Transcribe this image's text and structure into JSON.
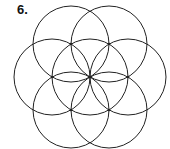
{
  "figure": {
    "label": "6.",
    "stroke_color": "#222222",
    "center": [
      90,
      77
    ],
    "radius": 38,
    "circles": [
      {
        "cx": 90,
        "cy": 77
      },
      {
        "cx": 128,
        "cy": 77
      },
      {
        "cx": 109,
        "cy": 44
      },
      {
        "cx": 71,
        "cy": 44
      },
      {
        "cx": 52,
        "cy": 77
      },
      {
        "cx": 71,
        "cy": 110
      },
      {
        "cx": 109,
        "cy": 110
      }
    ],
    "dots": [
      {
        "x": 90,
        "y": 77
      },
      {
        "x": 128,
        "y": 77
      },
      {
        "x": 109,
        "y": 44
      },
      {
        "x": 71,
        "y": 44
      },
      {
        "x": 52,
        "y": 77
      },
      {
        "x": 71,
        "y": 110
      },
      {
        "x": 109,
        "y": 110
      }
    ]
  }
}
